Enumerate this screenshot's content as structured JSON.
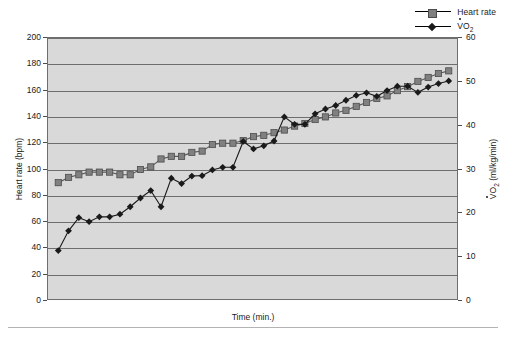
{
  "chart_data": {
    "type": "line",
    "title": "",
    "xlabel": "Time (min.)",
    "ylabel": "Heart rate (bpm)",
    "ylabel_secondary": "VO2 (ml/kg/min)",
    "grid": true,
    "legend_position": "top-right",
    "ylim": [
      0,
      200
    ],
    "ylim_secondary": [
      0,
      60
    ],
    "yticks": [
      0,
      20,
      40,
      60,
      80,
      100,
      120,
      140,
      160,
      180,
      200
    ],
    "yticks_secondary": [
      0,
      10,
      20,
      30,
      40,
      50,
      60
    ],
    "xticks": [],
    "x": [
      1,
      2,
      3,
      4,
      5,
      6,
      7,
      8,
      9,
      10,
      11,
      12,
      13,
      14,
      15,
      16,
      17,
      18,
      19,
      20,
      21,
      22,
      23,
      24,
      25,
      26,
      27,
      28,
      29,
      30,
      31,
      32,
      33,
      34,
      35,
      36,
      37,
      38,
      39
    ],
    "series": [
      {
        "name": "Heart rate",
        "axis": "left",
        "marker": "square",
        "color": "#808080",
        "values": [
          90,
          94,
          96,
          98,
          98,
          98,
          96,
          96,
          100,
          102,
          108,
          110,
          110,
          113,
          114,
          119,
          120,
          120,
          122,
          125,
          126,
          128,
          130,
          133,
          135,
          138,
          140,
          143,
          145,
          148,
          151,
          154,
          156,
          160,
          163,
          167,
          170,
          173,
          175
        ]
      },
      {
        "name": "VO2",
        "axis": "right",
        "marker": "diamond",
        "color": "#1a1a1a",
        "values": [
          11.5,
          16.0,
          19.0,
          18.1,
          19.2,
          19.2,
          19.8,
          21.5,
          23.5,
          25.2,
          21.5,
          28.0,
          26.8,
          28.5,
          28.6,
          29.9,
          30.5,
          30.5,
          36.4,
          34.7,
          35.4,
          36.5,
          42.0,
          40.3,
          40.3,
          42.7,
          43.8,
          44.6,
          45.8,
          46.9,
          47.5,
          46.7,
          48.0,
          49.0,
          49.0,
          47.6,
          48.8,
          49.6,
          50.2
        ]
      }
    ],
    "legend": [
      {
        "label": "Heart rate",
        "marker": "square",
        "color": "#808080"
      },
      {
        "label": "VO",
        "label_sub": "2",
        "marker": "diamond",
        "color": "#1a1a1a"
      }
    ]
  },
  "axes": {
    "left_label": "Heart rate (bpm)",
    "right_label_main": "O",
    "right_label_sub": "2",
    "right_label_tail": " (ml/kg/min)",
    "right_label_lead": "V",
    "x_label": "Time (min.)"
  },
  "colors": {
    "plot_background": "#d9d9d9",
    "grid": "#6e6e6e",
    "border": "#6e6e6e",
    "heart_rate": "#808080",
    "vo2": "#1a1a1a",
    "page_background": "#ffffff",
    "rule": "#b3b3b3"
  }
}
